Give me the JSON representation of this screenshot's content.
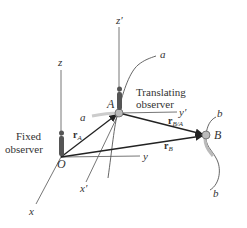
{
  "diagram": {
    "points": {
      "O": {
        "label": "O",
        "x": 61,
        "y": 157
      },
      "A": {
        "label": "A",
        "x": 119,
        "y": 113
      },
      "B": {
        "label": "B",
        "x": 206,
        "y": 135
      }
    },
    "axes": {
      "fixed": {
        "x": "x",
        "y": "y",
        "z": "z"
      },
      "translating": {
        "x": "x′",
        "y": "y′",
        "z": "z′"
      }
    },
    "vectors": {
      "rA": {
        "main": "r",
        "sub": "A"
      },
      "rB": {
        "main": "r",
        "sub": "B"
      },
      "rBA": {
        "main": "r",
        "sub": "B/A"
      }
    },
    "paths": {
      "a_top": "a",
      "a_left": "a",
      "b_top": "b",
      "b_bottom": "b"
    },
    "observers": {
      "fixed_line1": "Fixed",
      "fixed_line2": "observer",
      "translating_line1": "Translating",
      "translating_line2": "observer"
    },
    "colors": {
      "axis": "#666666",
      "vector": "#222222",
      "particle": "#bbbbbb",
      "observer": "#555555"
    }
  }
}
